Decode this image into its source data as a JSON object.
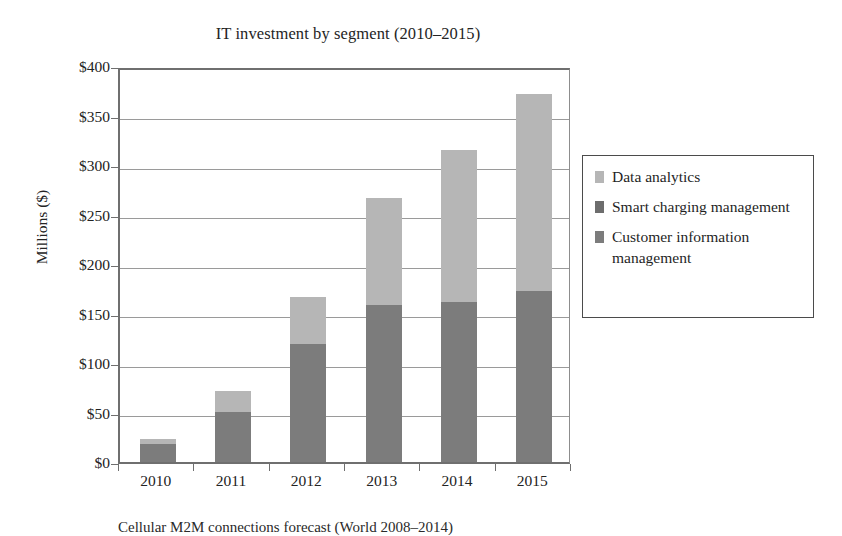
{
  "figure": {
    "caption": "Cellular M2M connections forecast (World 2008–2014)"
  },
  "chart_data": {
    "type": "bar",
    "subtype": "stacked-bar",
    "title": "IT investment by segment (2010–2015)",
    "xlabel": "",
    "ylabel": "Millions ($)",
    "categories": [
      "2010",
      "2011",
      "2012",
      "2013",
      "2014",
      "2015"
    ],
    "series": [
      {
        "name": "Customer information management",
        "color": "#7c7c7c",
        "values": [
          18,
          51,
          119,
          159,
          162,
          173
        ]
      },
      {
        "name": "Smart charging management",
        "color": "#6d6d6d",
        "values": [
          0,
          0,
          0,
          0,
          0,
          0
        ]
      },
      {
        "name": "Data analytics",
        "color": "#b6b6b6",
        "values": [
          5,
          21,
          48,
          108,
          153,
          199
        ]
      }
    ],
    "totals": [
      23,
      72,
      167,
      267,
      315,
      372
    ],
    "ylim": [
      0,
      400
    ],
    "yticks": [
      0,
      50,
      100,
      150,
      200,
      250,
      300,
      350,
      400
    ],
    "ytick_labels": [
      "$0",
      "$50",
      "$100",
      "$150",
      "$200",
      "$250",
      "$300",
      "$350",
      "$400"
    ],
    "grid": true,
    "legend_position": "right",
    "legend_entries": [
      {
        "label": "Data analytics",
        "color": "#b6b6b6",
        "swatch": "legend-swatch-data-analytics"
      },
      {
        "label": "Smart charging management",
        "color": "#6d6d6d",
        "swatch": "legend-swatch-smart-charging"
      },
      {
        "label": "Customer information management",
        "color": "#7c7c7c",
        "swatch": "legend-swatch-customer-information"
      }
    ]
  }
}
